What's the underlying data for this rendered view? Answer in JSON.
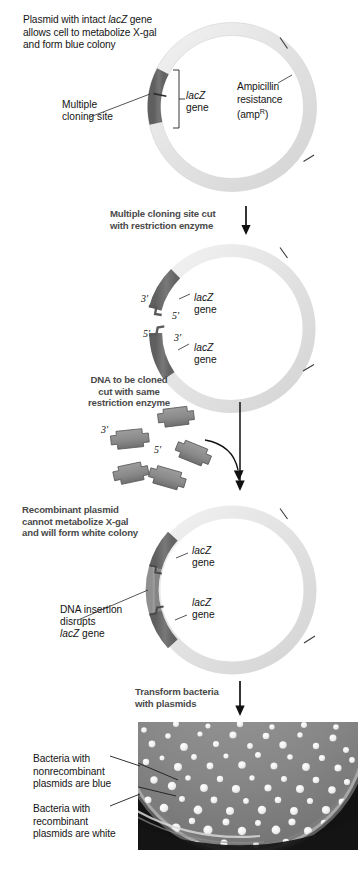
{
  "figure": {
    "colors": {
      "plasmid_backbone": "#e4e4e4",
      "lacz_segment": "#6f6f6f",
      "insert_dna": "#8c8c8c",
      "step_text": "#4a4a4a",
      "caption_text": "#151515",
      "arrow": "#111111"
    }
  },
  "panel1": {
    "caption_line1_pre": "Plasmid with intact ",
    "caption_line1_italic": "lacZ",
    "caption_line1_post": " gene",
    "caption_line2": "allows cell to metabolize X-gal",
    "caption_line3": "and form blue colony",
    "label_mcs_line1": "Multiple",
    "label_mcs_line2": "cloning site",
    "label_lacz_italic": "lacZ",
    "label_lacz_word": "gene",
    "label_amp_line1": "Ampicillin",
    "label_amp_line2": "resistance",
    "label_amp_line3_pre": "(amp",
    "label_amp_line3_sup": "R",
    "label_amp_line3_post": ")"
  },
  "step1": {
    "line1": "Multiple cloning site cut",
    "line2": "with restriction enzyme",
    "arrow": "down-arrow-icon"
  },
  "panel2": {
    "prime_top_3": "3′",
    "prime_top_5": "5′",
    "prime_bottom_5": "5′",
    "prime_bottom_3": "3′",
    "label_lacz_top_italic": "lacZ",
    "label_lacz_top_word": "gene",
    "label_lacz_bottom_italic": "lacZ",
    "label_lacz_bottom_word": "gene"
  },
  "step2": {
    "line1": "DNA to be cloned",
    "line2": "cut with same",
    "line3": "restriction enzyme",
    "arrow": "curved-down-arrow-icon"
  },
  "fragments": {
    "prime_3": "3′",
    "prime_5": "5′",
    "count": 5
  },
  "panel3": {
    "caption_line1": "Recombinant plasmid",
    "caption_line2": "cannot metabolize X-gal",
    "caption_line3": "and will form white colony",
    "label_insert_line1": "DNA insertion",
    "label_insert_line2": "disrupts",
    "label_insert_line3_italic": "lacZ",
    "label_insert_line3_post": " gene",
    "label_lacz_top_italic": "lacZ",
    "label_lacz_top_word": "gene",
    "label_lacz_bottom_italic": "lacZ",
    "label_lacz_bottom_word": "gene"
  },
  "step3": {
    "line1": "Transform bacteria",
    "line2": "with plasmids",
    "arrow": "down-arrow-icon"
  },
  "panel4": {
    "label_blue_line1": "Bacteria with",
    "label_blue_line2": "nonrecombinant",
    "label_blue_line3": "plasmids are blue",
    "label_white_line1": "Bacteria with",
    "label_white_line2": "recombinant",
    "label_white_line3": "plasmids are white",
    "photo_alt": "petri-dish-with-bacterial-colonies"
  }
}
